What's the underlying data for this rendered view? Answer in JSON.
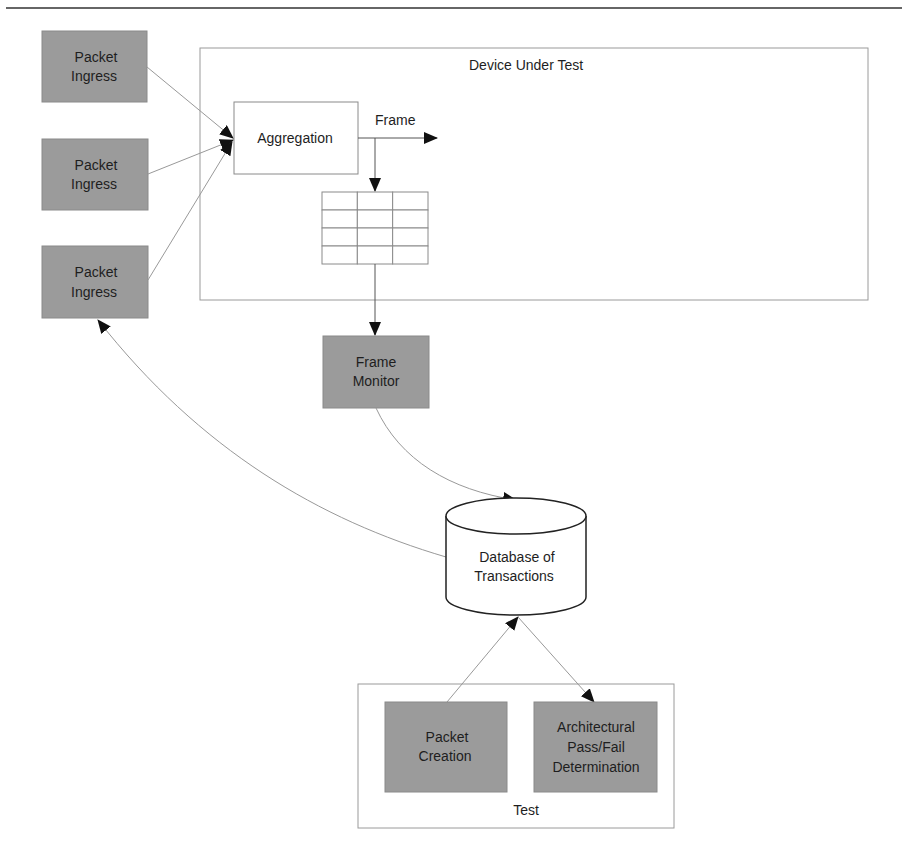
{
  "diagram": {
    "colors": {
      "process_fill": "#9b9b9b",
      "line": "#8a8a8a",
      "dark_line": "#222222",
      "arrowhead": "#111111",
      "background": "#ffffff"
    },
    "containers": {
      "dut": {
        "label": "Device Under Test"
      },
      "test": {
        "label": "Test"
      }
    },
    "nodes": {
      "ingress1": {
        "lines": [
          "Packet",
          "Ingress"
        ]
      },
      "ingress2": {
        "lines": [
          "Packet",
          "Ingress"
        ]
      },
      "ingress3": {
        "lines": [
          "Packet",
          "Ingress"
        ]
      },
      "aggregation": {
        "lines": [
          "Aggregation"
        ]
      },
      "frame_label": {
        "text": "Frame"
      },
      "frame_buffer": {
        "rows": 4,
        "cols": 3
      },
      "frame_monitor": {
        "lines": [
          "Frame",
          "Monitor"
        ]
      },
      "database": {
        "lines": [
          "Database of",
          "Transactions"
        ]
      },
      "packet_creation": {
        "lines": [
          "Packet",
          "Creation"
        ]
      },
      "arch_pass_fail": {
        "lines": [
          "Architectural",
          "Pass/Fail",
          "Determination"
        ]
      }
    },
    "edges": [
      {
        "from": "ingress1",
        "to": "aggregation"
      },
      {
        "from": "ingress2",
        "to": "aggregation"
      },
      {
        "from": "ingress3",
        "to": "aggregation"
      },
      {
        "from": "aggregation",
        "to": "frame-output",
        "label": "Frame"
      },
      {
        "from": "aggregation",
        "to": "frame_buffer"
      },
      {
        "from": "frame_buffer",
        "to": "frame_monitor"
      },
      {
        "from": "frame_monitor",
        "to": "database"
      },
      {
        "from": "database",
        "to": "ingress3"
      },
      {
        "from": "packet_creation",
        "to": "database"
      },
      {
        "from": "database",
        "to": "arch_pass_fail"
      }
    ]
  }
}
